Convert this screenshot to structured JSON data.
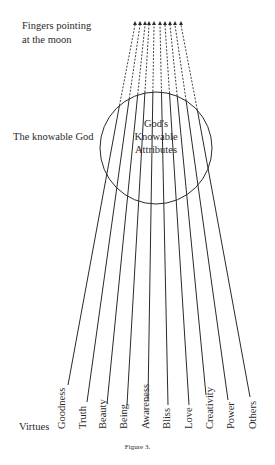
{
  "labels": {
    "fingers": "Fingers pointing",
    "fingers2": "at the moon",
    "knowable_god": "The knowable God",
    "circle_line1": "God's",
    "circle_line2": "Knowable",
    "circle_line3": "Attributes",
    "virtues": "Virtues",
    "caption": "Figure 3."
  },
  "virtues": [
    "Goodness",
    "Truth",
    "Beauty",
    "Being",
    "Awareness",
    "Bliss",
    "Love",
    "Creativity",
    "Power",
    "Others"
  ],
  "colors": {
    "line": "#2a2a2a",
    "background": "#ffffff"
  }
}
